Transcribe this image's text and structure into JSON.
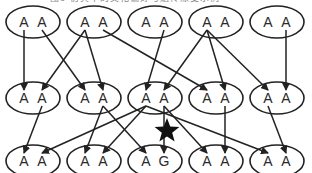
{
  "title": "图8  仿真中的文化偏好与遗传漂变示例",
  "colors": {
    "stroke": "#222222",
    "text": "#2a2a2a",
    "star": "#111111"
  },
  "rows": [
    {
      "name": "generation-1",
      "cy": 22,
      "nodes": [
        {
          "cx": 33,
          "alleles": [
            "A",
            "A"
          ]
        },
        {
          "cx": 94,
          "alleles": [
            "A",
            "A"
          ]
        },
        {
          "cx": 155,
          "alleles": [
            "A",
            "A"
          ]
        },
        {
          "cx": 216,
          "alleles": [
            "A",
            "A"
          ]
        },
        {
          "cx": 277,
          "alleles": [
            "A",
            "A"
          ]
        }
      ]
    },
    {
      "name": "generation-2",
      "cy": 98,
      "nodes": [
        {
          "cx": 33,
          "alleles": [
            "A",
            "A"
          ]
        },
        {
          "cx": 94,
          "alleles": [
            "A",
            "A"
          ]
        },
        {
          "cx": 155,
          "alleles": [
            "A",
            "A"
          ]
        },
        {
          "cx": 216,
          "alleles": [
            "A",
            "A"
          ]
        },
        {
          "cx": 277,
          "alleles": [
            "A",
            "A"
          ]
        }
      ]
    },
    {
      "name": "generation-3",
      "cy": 161,
      "nodes": [
        {
          "cx": 33,
          "alleles": [
            "A",
            "A"
          ]
        },
        {
          "cx": 94,
          "alleles": [
            "A",
            "A"
          ]
        },
        {
          "cx": 155,
          "alleles": [
            "A",
            "G"
          ]
        },
        {
          "cx": 216,
          "alleles": [
            "A",
            "A"
          ]
        },
        {
          "cx": 277,
          "alleles": [
            "A",
            "A"
          ]
        }
      ]
    }
  ],
  "edges": [
    {
      "from": [
        0,
        0,
        0
      ],
      "to": [
        1,
        0,
        0
      ]
    },
    {
      "from": [
        0,
        0,
        1
      ],
      "to": [
        1,
        1,
        0
      ]
    },
    {
      "from": [
        0,
        1,
        0
      ],
      "to": [
        1,
        0,
        1
      ]
    },
    {
      "from": [
        0,
        1,
        0
      ],
      "to": [
        1,
        1,
        1
      ]
    },
    {
      "from": [
        0,
        1,
        1
      ],
      "to": [
        1,
        3,
        0
      ]
    },
    {
      "from": [
        0,
        2,
        1
      ],
      "to": [
        1,
        2,
        0
      ]
    },
    {
      "from": [
        0,
        3,
        0
      ],
      "to": [
        1,
        2,
        1
      ]
    },
    {
      "from": [
        0,
        3,
        0
      ],
      "to": [
        1,
        3,
        1
      ]
    },
    {
      "from": [
        0,
        3,
        0
      ],
      "to": [
        1,
        4,
        0
      ]
    },
    {
      "from": [
        0,
        4,
        1
      ],
      "to": [
        1,
        4,
        1
      ]
    },
    {
      "from": [
        1,
        0,
        1
      ],
      "to": [
        2,
        0,
        0
      ]
    },
    {
      "from": [
        1,
        1,
        1
      ],
      "to": [
        2,
        1,
        0
      ]
    },
    {
      "from": [
        1,
        1,
        1
      ],
      "to": [
        2,
        2,
        0
      ]
    },
    {
      "from": [
        1,
        2,
        0
      ],
      "to": [
        2,
        0,
        1
      ]
    },
    {
      "from": [
        1,
        2,
        0
      ],
      "to": [
        2,
        1,
        1
      ]
    },
    {
      "from": [
        1,
        2,
        0
      ],
      "to": [
        2,
        4,
        0
      ]
    },
    {
      "from": [
        1,
        2,
        1
      ],
      "to": [
        2,
        2,
        1
      ]
    },
    {
      "from": [
        1,
        2,
        1
      ],
      "to": [
        2,
        3,
        0
      ]
    },
    {
      "from": [
        1,
        3,
        1
      ],
      "to": [
        2,
        3,
        1
      ]
    },
    {
      "from": [
        1,
        4,
        0
      ],
      "to": [
        2,
        4,
        1
      ]
    }
  ],
  "mutation_marker": {
    "shape": "star",
    "cx": 167,
    "cy": 131,
    "r": 13,
    "label": "mutation"
  }
}
